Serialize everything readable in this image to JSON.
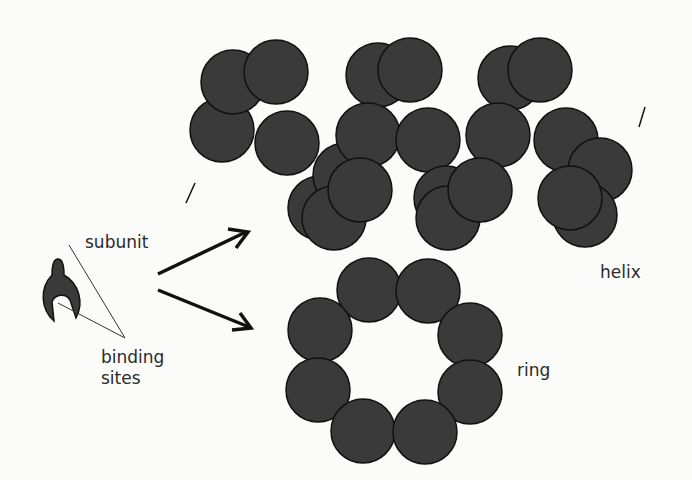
{
  "labels": {
    "subunit": "subunit",
    "binding_line1": "binding",
    "binding_line2": "sites",
    "helix": "helix",
    "ring": "ring"
  },
  "colors": {
    "subunit_fill": "#3a3a3a",
    "outline": "#111111",
    "background": "#fbfbfa",
    "text": "#2a2a2a"
  },
  "radius": 32,
  "helix_circles": [
    [
      222,
      130
    ],
    [
      233,
      82
    ],
    [
      276,
      72
    ],
    [
      287,
      143
    ],
    [
      320,
      208
    ],
    [
      345,
      175
    ],
    [
      334,
      218
    ],
    [
      378,
      75
    ],
    [
      410,
      70
    ],
    [
      368,
      135
    ],
    [
      360,
      190
    ],
    [
      428,
      140
    ],
    [
      446,
      198
    ],
    [
      448,
      218
    ],
    [
      510,
      78
    ],
    [
      540,
      70
    ],
    [
      498,
      135
    ],
    [
      480,
      190
    ],
    [
      566,
      140
    ],
    [
      600,
      170
    ],
    [
      585,
      215
    ],
    [
      570,
      198
    ]
  ],
  "ring_circles": [
    [
      369,
      290
    ],
    [
      428,
      291
    ],
    [
      320,
      330
    ],
    [
      470,
      335
    ],
    [
      318,
      390
    ],
    [
      470,
      392
    ],
    [
      363,
      431
    ],
    [
      425,
      432
    ]
  ]
}
